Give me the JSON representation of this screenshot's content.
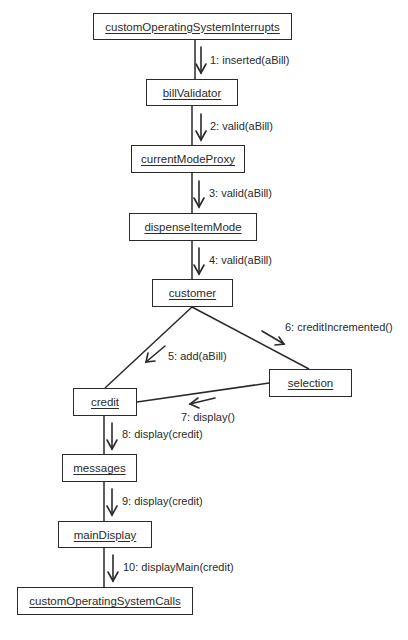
{
  "diagram": {
    "type": "UML collaboration diagram",
    "colors": {
      "line": "#2a2a2a",
      "text": "#2b2b2b",
      "background": "#ffffff"
    },
    "objects": [
      {
        "id": "customOperatingSystemInterrupts",
        "label": "customOperatingSystemInterrupts"
      },
      {
        "id": "billValidator",
        "label": "billValidator"
      },
      {
        "id": "currentModeProxy",
        "label": "currentModeProxy"
      },
      {
        "id": "dispenseItemMode",
        "label": "dispenseItemMode"
      },
      {
        "id": "customer",
        "label": "customer"
      },
      {
        "id": "credit",
        "label": "credit"
      },
      {
        "id": "selection",
        "label": "selection"
      },
      {
        "id": "messages",
        "label": "messages"
      },
      {
        "id": "mainDisplay",
        "label": "mainDisplay"
      },
      {
        "id": "customOperatingSystemCalls",
        "label": "customOperatingSystemCalls"
      }
    ],
    "messages": [
      {
        "seq": 1,
        "label": "1: inserted(aBill)",
        "from": "customOperatingSystemInterrupts",
        "to": "billValidator"
      },
      {
        "seq": 2,
        "label": "2: valid(aBill)",
        "from": "billValidator",
        "to": "currentModeProxy"
      },
      {
        "seq": 3,
        "label": "3: valid(aBill)",
        "from": "currentModeProxy",
        "to": "dispenseItemMode"
      },
      {
        "seq": 4,
        "label": "4: valid(aBill)",
        "from": "dispenseItemMode",
        "to": "customer"
      },
      {
        "seq": 5,
        "label": "5: add(aBill)",
        "from": "customer",
        "to": "credit"
      },
      {
        "seq": 6,
        "label": "6: creditIncremented()",
        "from": "customer",
        "to": "selection"
      },
      {
        "seq": 7,
        "label": "7: display()",
        "from": "selection",
        "to": "credit"
      },
      {
        "seq": 8,
        "label": "8: display(credit)",
        "from": "credit",
        "to": "messages"
      },
      {
        "seq": 9,
        "label": "9: display(credit)",
        "from": "messages",
        "to": "mainDisplay"
      },
      {
        "seq": 10,
        "label": "10: displayMain(credit)",
        "from": "mainDisplay",
        "to": "customOperatingSystemCalls"
      }
    ]
  }
}
